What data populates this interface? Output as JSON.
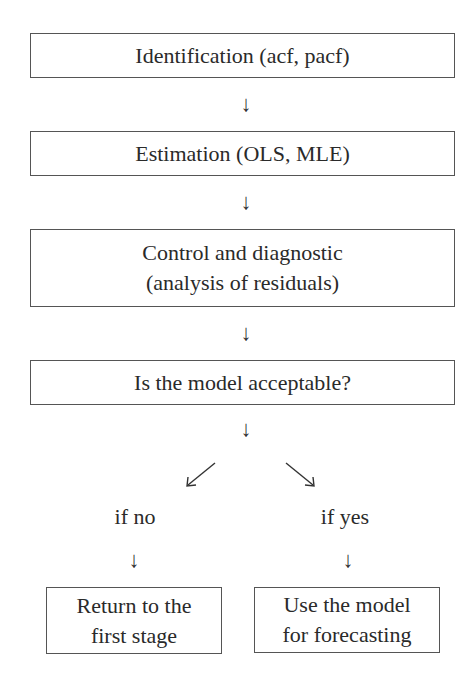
{
  "flowchart": {
    "steps": [
      {
        "label": "Identification (acf, pacf)"
      },
      {
        "label": "Estimation (OLS, MLE)"
      },
      {
        "line1": "Control and diagnostic",
        "line2": "(analysis of residuals)"
      },
      {
        "label": "Is the model acceptable?"
      }
    ],
    "arrows": {
      "down": "↓"
    },
    "branches": {
      "no": {
        "condition": "if no",
        "line1": "Return to the",
        "line2": "first stage"
      },
      "yes": {
        "condition": "if yes",
        "line1": "Use the model",
        "line2": "for forecasting"
      }
    },
    "colors": {
      "border": "#555555",
      "text": "#2a2a2a"
    }
  }
}
